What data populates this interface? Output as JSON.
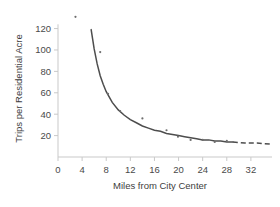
{
  "chart_data": {
    "type": "scatter",
    "title": "",
    "subtitle": "",
    "xlabel": "Miles from City Center",
    "ylabel": "Trips per Residential Acre",
    "xlim": [
      0,
      35.5
    ],
    "ylim": [
      0,
      128
    ],
    "xticks": [
      0,
      4,
      8,
      12,
      16,
      20,
      24,
      28,
      32
    ],
    "yticks": [
      20,
      40,
      60,
      80,
      100,
      120
    ],
    "xtick_labels": [
      "0",
      "4",
      "8",
      "12",
      "16",
      "20",
      "24",
      "28",
      "32"
    ],
    "ytick_labels": [
      "20",
      "40",
      "60",
      "80",
      "100",
      "120"
    ],
    "grid": false,
    "legend": "none",
    "series": [
      {
        "name": "Observed trip rates",
        "type": "scatter",
        "marker": "dot",
        "color": "#6e6e6e",
        "points": [
          {
            "x": 2.9,
            "y": 131
          },
          {
            "x": 7.0,
            "y": 98
          },
          {
            "x": 8.3,
            "y": 59
          },
          {
            "x": 10.3,
            "y": 43
          },
          {
            "x": 14.0,
            "y": 36
          },
          {
            "x": 18.0,
            "y": 25
          },
          {
            "x": 19.9,
            "y": 19
          },
          {
            "x": 22.0,
            "y": 16
          },
          {
            "x": 24.0,
            "y": 16
          },
          {
            "x": 26.0,
            "y": 14
          },
          {
            "x": 28.0,
            "y": 15
          }
        ]
      },
      {
        "name": "Fitted decay curve",
        "type": "line",
        "color": "#4d4d4d",
        "style": "solid",
        "x_range": [
          5.5,
          29.0
        ],
        "points": [
          {
            "x": 5.5,
            "y": 119
          },
          {
            "x": 6.0,
            "y": 101
          },
          {
            "x": 6.5,
            "y": 87
          },
          {
            "x": 7.0,
            "y": 76
          },
          {
            "x": 7.5,
            "y": 68
          },
          {
            "x": 8.0,
            "y": 61
          },
          {
            "x": 9.0,
            "y": 51
          },
          {
            "x": 10.0,
            "y": 44
          },
          {
            "x": 11.0,
            "y": 39
          },
          {
            "x": 12.0,
            "y": 35
          },
          {
            "x": 13.0,
            "y": 32
          },
          {
            "x": 14.0,
            "y": 29
          },
          {
            "x": 15.0,
            "y": 27
          },
          {
            "x": 16.0,
            "y": 25
          },
          {
            "x": 17.0,
            "y": 24
          },
          {
            "x": 18.0,
            "y": 22
          },
          {
            "x": 19.0,
            "y": 21
          },
          {
            "x": 20.0,
            "y": 20
          },
          {
            "x": 21.0,
            "y": 19
          },
          {
            "x": 22.0,
            "y": 18
          },
          {
            "x": 23.0,
            "y": 17
          },
          {
            "x": 24.0,
            "y": 16
          },
          {
            "x": 25.0,
            "y": 16
          },
          {
            "x": 26.0,
            "y": 15
          },
          {
            "x": 27.0,
            "y": 15
          },
          {
            "x": 28.0,
            "y": 14
          },
          {
            "x": 29.0,
            "y": 14
          }
        ]
      },
      {
        "name": "Extrapolated tail",
        "type": "line",
        "color": "#4d4d4d",
        "style": "dashed",
        "x_range": [
          29.0,
          35.5
        ],
        "points": [
          {
            "x": 29.0,
            "y": 14
          },
          {
            "x": 31.0,
            "y": 13
          },
          {
            "x": 33.0,
            "y": 13
          },
          {
            "x": 35.5,
            "y": 12
          }
        ]
      }
    ]
  }
}
